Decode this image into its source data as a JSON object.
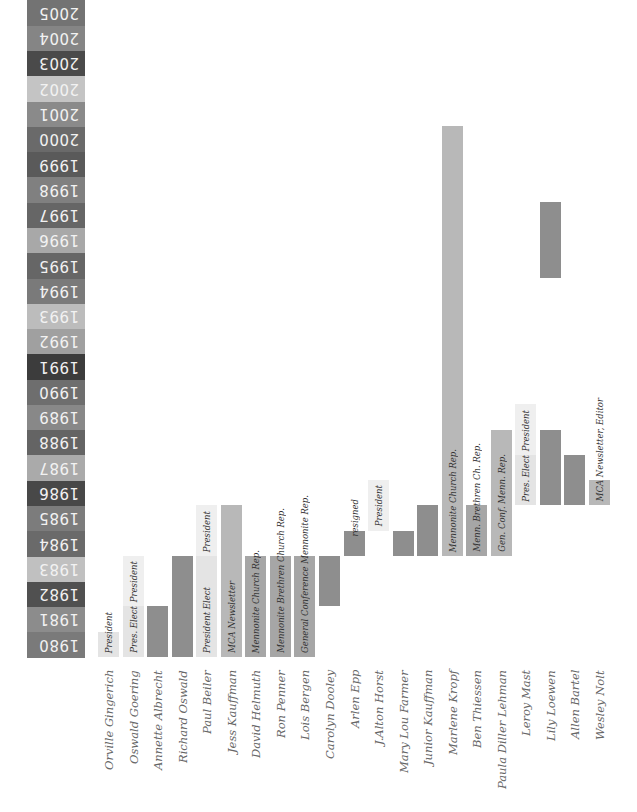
{
  "chart_data": {
    "type": "timeline",
    "title": "",
    "orientation": "rotated (years on vertical axis, upside-down labels; names read bottom-to-top)",
    "year_axis": {
      "start": 1980,
      "end": 2005,
      "labels": [
        "1980",
        "1981",
        "1982",
        "1983",
        "1984",
        "1985",
        "1986",
        "1987",
        "1988",
        "1989",
        "1990",
        "1991",
        "1992",
        "1993",
        "1994",
        "1995",
        "1996",
        "1997",
        "1998",
        "1999",
        "2000",
        "2001",
        "2002",
        "2003",
        "2004",
        "2005"
      ],
      "colors": [
        "#7a7a7a",
        "#8c8c8c",
        "#505050",
        "#c0c0c0",
        "#6a6a6a",
        "#7c7c7c",
        "#484848",
        "#aaaaaa",
        "#646464",
        "#888888",
        "#6e6e6e",
        "#3c3c3c",
        "#a0a0a0",
        "#bcbcbc",
        "#7a7a7a",
        "#666666",
        "#a8a8a8",
        "#666666",
        "#808080",
        "#5a5a5a",
        "#6a6a6a",
        "#8a8a8a",
        "#c4c4c4",
        "#4a4a4a",
        "#858585",
        "#737373"
      ]
    },
    "people": [
      {
        "name": "Orville Gingerich",
        "segments": [
          {
            "start": 1980,
            "end": 1980,
            "label": "President",
            "shade": "light"
          }
        ]
      },
      {
        "name": "Oswald Goering",
        "segments": [
          {
            "start": 1980,
            "end": 1981,
            "label": "Pres. Elect",
            "shade": "light"
          },
          {
            "start": 1982,
            "end": 1983,
            "label": "President",
            "shade": "lighter"
          }
        ]
      },
      {
        "name": "Annette Albrecht",
        "segments": [
          {
            "start": 1980,
            "end": 1981,
            "label": "",
            "shade": "dark"
          }
        ]
      },
      {
        "name": "Richard Oswald",
        "segments": [
          {
            "start": 1980,
            "end": 1983,
            "label": "",
            "shade": "dark"
          }
        ]
      },
      {
        "name": "Paul Beiler",
        "segments": [
          {
            "start": 1980,
            "end": 1983,
            "label": "President Elect",
            "shade": "light"
          },
          {
            "start": 1984,
            "end": 1985,
            "label": "President",
            "shade": "lighter"
          }
        ]
      },
      {
        "name": "Jess Kauffman",
        "segments": [
          {
            "start": 1980,
            "end": 1985,
            "label": "MCA Newsletter",
            "shade": "mid"
          }
        ]
      },
      {
        "name": "David Helmuth",
        "segments": [
          {
            "start": 1980,
            "end": 1983,
            "label": "Mennonite Church Rep.",
            "shade": "mid-dark"
          }
        ]
      },
      {
        "name": "Ron Penner",
        "segments": [
          {
            "start": 1980,
            "end": 1983,
            "label": "Mennonite Brethren Church Rep.",
            "shade": "mid-dark"
          }
        ]
      },
      {
        "name": "Lois Bergen",
        "segments": [
          {
            "start": 1980,
            "end": 1983,
            "label": "General Conference Mennonite Rep.",
            "shade": "mid-dark"
          }
        ]
      },
      {
        "name": "Carolyn Dooley",
        "segments": [
          {
            "start": 1982,
            "end": 1983,
            "label": "",
            "shade": "dark"
          }
        ]
      },
      {
        "name": "Arlen Epp",
        "segments": [
          {
            "start": 1984,
            "end": 1984,
            "label": "",
            "shade": "dark"
          }
        ],
        "note": "resigned"
      },
      {
        "name": "J.Alton Horst",
        "segments": [
          {
            "start": 1985,
            "end": 1986,
            "label": "President",
            "shade": "lighter"
          }
        ]
      },
      {
        "name": "Mary Lou Farmer",
        "segments": [
          {
            "start": 1984,
            "end": 1984,
            "label": "",
            "shade": "dark"
          }
        ]
      },
      {
        "name": "Junior Kauffman",
        "segments": [
          {
            "start": 1984,
            "end": 1985,
            "label": "",
            "shade": "dark"
          }
        ]
      },
      {
        "name": "Marlene Kropf",
        "segments": [
          {
            "start": 1984,
            "end": 2000,
            "label": "Mennonite Church Rep.",
            "shade": "mid"
          }
        ]
      },
      {
        "name": "Ben Thiessen",
        "segments": [
          {
            "start": 1984,
            "end": 1985,
            "label": "Menn. Brethren Ch. Rep.",
            "shade": "mid-dark"
          }
        ]
      },
      {
        "name": "Paula Diller Lehman",
        "segments": [
          {
            "start": 1984,
            "end": 1988,
            "label": "Gen. Conf. Menn. Rep.",
            "shade": "mid"
          }
        ]
      },
      {
        "name": "Leroy Mast",
        "segments": [
          {
            "start": 1986,
            "end": 1987,
            "label": "Pres. Elect",
            "shade": "light"
          },
          {
            "start": 1988,
            "end": 1989,
            "label": "President",
            "shade": "lighter"
          }
        ]
      },
      {
        "name": "Lily Loewen",
        "segments": [
          {
            "start": 1986,
            "end": 1988,
            "label": "",
            "shade": "dark"
          },
          {
            "start": 1995,
            "end": 1997,
            "label": "",
            "shade": "dark"
          }
        ]
      },
      {
        "name": "Allen Bartel",
        "segments": [
          {
            "start": 1986,
            "end": 1987,
            "label": "",
            "shade": "dark"
          }
        ]
      },
      {
        "name": "Wesley Nolt",
        "segments": [
          {
            "start": 1986,
            "end": 1986,
            "label": "MCA Newsletter, Editor",
            "shade": "mid"
          }
        ]
      }
    ],
    "shade_colors": {
      "dark": "#8e8e8e",
      "mid-dark": "#a6a6a6",
      "mid": "#b8b8b8",
      "light": "#e4e4e4",
      "lighter": "#efefef"
    }
  }
}
